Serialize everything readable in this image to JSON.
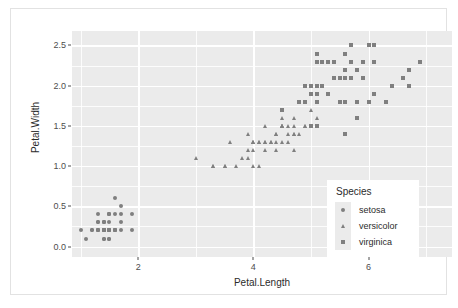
{
  "chart_data": {
    "type": "scatter",
    "title": "",
    "xlabel": "Petal.Length",
    "ylabel": "Petal.Width",
    "xlim": [
      0.85,
      7.45
    ],
    "ylim": [
      -0.13,
      2.68
    ],
    "xticks": [
      2,
      4,
      6
    ],
    "xtick_labels": [
      "2",
      "4",
      "6"
    ],
    "yticks": [
      0.0,
      0.5,
      1.0,
      1.5,
      2.0,
      2.5
    ],
    "ytick_labels": [
      "0.0",
      "0.5",
      "1.0",
      "1.5",
      "2.0",
      "2.5"
    ],
    "grid": true,
    "grid_major_color": "#ffffff",
    "panel_color": "#ebebeb",
    "point_color": "#7f7f7f",
    "legend": {
      "title": "Species",
      "position": "inside-bottom-right",
      "entries": [
        {
          "label": "setosa",
          "marker": "circle"
        },
        {
          "label": "versicolor",
          "marker": "triangle"
        },
        {
          "label": "virginica",
          "marker": "square"
        }
      ]
    },
    "series": [
      {
        "name": "setosa",
        "marker": "circle",
        "points": [
          [
            1.4,
            0.2
          ],
          [
            1.4,
            0.2
          ],
          [
            1.3,
            0.2
          ],
          [
            1.5,
            0.2
          ],
          [
            1.4,
            0.2
          ],
          [
            1.7,
            0.4
          ],
          [
            1.4,
            0.3
          ],
          [
            1.5,
            0.2
          ],
          [
            1.4,
            0.2
          ],
          [
            1.5,
            0.1
          ],
          [
            1.5,
            0.2
          ],
          [
            1.6,
            0.2
          ],
          [
            1.4,
            0.1
          ],
          [
            1.1,
            0.1
          ],
          [
            1.2,
            0.2
          ],
          [
            1.5,
            0.4
          ],
          [
            1.3,
            0.4
          ],
          [
            1.4,
            0.3
          ],
          [
            1.7,
            0.3
          ],
          [
            1.5,
            0.3
          ],
          [
            1.7,
            0.2
          ],
          [
            1.5,
            0.4
          ],
          [
            1.0,
            0.2
          ],
          [
            1.7,
            0.5
          ],
          [
            1.9,
            0.2
          ],
          [
            1.6,
            0.2
          ],
          [
            1.6,
            0.4
          ],
          [
            1.5,
            0.2
          ],
          [
            1.4,
            0.2
          ],
          [
            1.6,
            0.2
          ],
          [
            1.6,
            0.2
          ],
          [
            1.5,
            0.4
          ],
          [
            1.5,
            0.1
          ],
          [
            1.4,
            0.2
          ],
          [
            1.5,
            0.2
          ],
          [
            1.2,
            0.2
          ],
          [
            1.3,
            0.2
          ],
          [
            1.4,
            0.1
          ],
          [
            1.3,
            0.2
          ],
          [
            1.5,
            0.2
          ],
          [
            1.3,
            0.3
          ],
          [
            1.3,
            0.3
          ],
          [
            1.3,
            0.2
          ],
          [
            1.6,
            0.6
          ],
          [
            1.9,
            0.4
          ],
          [
            1.4,
            0.3
          ],
          [
            1.6,
            0.2
          ],
          [
            1.4,
            0.2
          ],
          [
            1.5,
            0.2
          ],
          [
            1.4,
            0.2
          ]
        ]
      },
      {
        "name": "versicolor",
        "marker": "triangle",
        "points": [
          [
            4.7,
            1.4
          ],
          [
            4.5,
            1.5
          ],
          [
            4.9,
            1.5
          ],
          [
            4.0,
            1.3
          ],
          [
            4.6,
            1.5
          ],
          [
            4.5,
            1.3
          ],
          [
            4.7,
            1.6
          ],
          [
            3.3,
            1.0
          ],
          [
            4.6,
            1.3
          ],
          [
            3.9,
            1.4
          ],
          [
            3.5,
            1.0
          ],
          [
            4.2,
            1.5
          ],
          [
            4.0,
            1.0
          ],
          [
            4.7,
            1.4
          ],
          [
            3.6,
            1.3
          ],
          [
            4.4,
            1.4
          ],
          [
            4.5,
            1.5
          ],
          [
            4.1,
            1.0
          ],
          [
            4.5,
            1.5
          ],
          [
            3.9,
            1.1
          ],
          [
            4.8,
            1.8
          ],
          [
            4.0,
            1.3
          ],
          [
            4.9,
            1.5
          ],
          [
            4.7,
            1.2
          ],
          [
            4.3,
            1.3
          ],
          [
            4.4,
            1.4
          ],
          [
            4.8,
            1.4
          ],
          [
            5.0,
            1.7
          ],
          [
            4.5,
            1.5
          ],
          [
            3.5,
            1.0
          ],
          [
            3.8,
            1.1
          ],
          [
            3.7,
            1.0
          ],
          [
            3.9,
            1.2
          ],
          [
            5.1,
            1.6
          ],
          [
            4.5,
            1.5
          ],
          [
            4.5,
            1.6
          ],
          [
            4.7,
            1.5
          ],
          [
            4.4,
            1.3
          ],
          [
            4.1,
            1.3
          ],
          [
            4.0,
            1.3
          ],
          [
            4.4,
            1.2
          ],
          [
            4.6,
            1.4
          ],
          [
            4.0,
            1.2
          ],
          [
            3.3,
            1.0
          ],
          [
            4.2,
            1.3
          ],
          [
            4.2,
            1.2
          ],
          [
            4.2,
            1.3
          ],
          [
            4.3,
            1.3
          ],
          [
            3.0,
            1.1
          ],
          [
            4.1,
            1.3
          ]
        ]
      },
      {
        "name": "virginica",
        "marker": "square",
        "points": [
          [
            6.0,
            2.5
          ],
          [
            5.1,
            1.9
          ],
          [
            5.9,
            2.1
          ],
          [
            5.6,
            1.8
          ],
          [
            5.8,
            2.2
          ],
          [
            6.6,
            2.1
          ],
          [
            4.5,
            1.7
          ],
          [
            6.3,
            1.8
          ],
          [
            5.8,
            1.8
          ],
          [
            6.1,
            2.5
          ],
          [
            5.1,
            2.0
          ],
          [
            5.3,
            1.9
          ],
          [
            5.5,
            2.1
          ],
          [
            5.0,
            2.0
          ],
          [
            5.1,
            2.4
          ],
          [
            5.3,
            2.3
          ],
          [
            5.5,
            1.8
          ],
          [
            6.7,
            2.2
          ],
          [
            6.9,
            2.3
          ],
          [
            5.0,
            1.5
          ],
          [
            5.7,
            2.3
          ],
          [
            4.9,
            2.0
          ],
          [
            6.7,
            2.0
          ],
          [
            4.9,
            1.8
          ],
          [
            5.7,
            2.1
          ],
          [
            6.0,
            1.8
          ],
          [
            4.8,
            1.8
          ],
          [
            4.9,
            1.8
          ],
          [
            5.6,
            2.1
          ],
          [
            5.8,
            1.6
          ],
          [
            6.1,
            1.9
          ],
          [
            6.4,
            2.0
          ],
          [
            5.6,
            2.2
          ],
          [
            5.1,
            1.5
          ],
          [
            5.6,
            1.4
          ],
          [
            6.1,
            2.3
          ],
          [
            5.6,
            2.4
          ],
          [
            5.5,
            1.8
          ],
          [
            4.8,
            1.8
          ],
          [
            5.4,
            2.1
          ],
          [
            5.6,
            2.4
          ],
          [
            5.1,
            2.3
          ],
          [
            5.1,
            1.9
          ],
          [
            5.9,
            2.3
          ],
          [
            5.7,
            2.5
          ],
          [
            5.2,
            2.3
          ],
          [
            5.0,
            1.9
          ],
          [
            5.2,
            2.0
          ],
          [
            5.4,
            2.3
          ],
          [
            5.1,
            1.8
          ]
        ]
      }
    ]
  }
}
